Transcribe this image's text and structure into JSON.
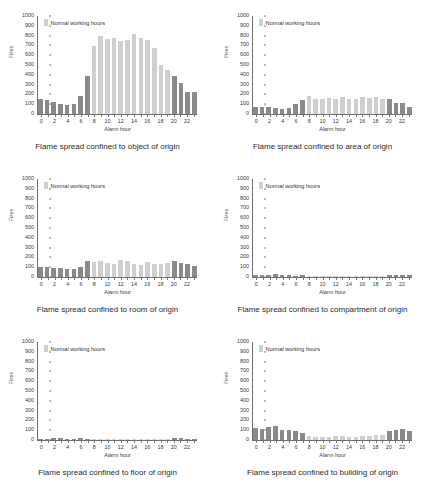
{
  "figure": {
    "legend_label": "Normal working hours",
    "xlabel": "Alarm hour",
    "ylabel": "Fires",
    "yticks": [
      1000,
      900,
      800,
      700,
      600,
      500,
      400,
      300,
      200,
      100,
      0
    ],
    "xticks": [
      0,
      2,
      4,
      6,
      8,
      10,
      12,
      14,
      16,
      18,
      20,
      22
    ],
    "colors": {
      "normal_working_hours": "#cfcfcf",
      "outside_working_hours": "#8a8a8a",
      "axis": "#6e6e6e",
      "text": "#2b2b2b",
      "background": "#ffffff"
    }
  },
  "chart_data": [
    {
      "type": "bar",
      "title": "Flame spread confined to object of origin",
      "xlabel": "Alarm hour",
      "ylabel": "Fires",
      "ylim": [
        0,
        1000
      ],
      "grid": false,
      "legend": "Normal working hours",
      "legend_position": "top-left",
      "categories": [
        0,
        1,
        2,
        3,
        4,
        5,
        6,
        7,
        8,
        9,
        10,
        11,
        12,
        13,
        14,
        15,
        16,
        17,
        18,
        19,
        20,
        21,
        22,
        23
      ],
      "values": [
        150,
        140,
        125,
        105,
        95,
        100,
        180,
        385,
        690,
        800,
        765,
        775,
        740,
        755,
        820,
        780,
        760,
        670,
        500,
        450,
        390,
        315,
        225,
        220
      ],
      "working_hours_mask": [
        false,
        false,
        false,
        false,
        false,
        false,
        false,
        false,
        true,
        true,
        true,
        true,
        true,
        true,
        true,
        true,
        true,
        true,
        true,
        true,
        false,
        false,
        false,
        false
      ]
    },
    {
      "type": "bar",
      "title": "Flame spread confined to area of origin",
      "xlabel": "Alarm hour",
      "ylabel": "Fires",
      "ylim": [
        0,
        1000
      ],
      "grid": false,
      "legend": "Normal working hours",
      "legend_position": "top-left",
      "categories": [
        0,
        1,
        2,
        3,
        4,
        5,
        6,
        7,
        8,
        9,
        10,
        11,
        12,
        13,
        14,
        15,
        16,
        17,
        18,
        19,
        20,
        21,
        22,
        23
      ],
      "values": [
        75,
        72,
        70,
        60,
        55,
        58,
        105,
        140,
        180,
        155,
        150,
        160,
        155,
        175,
        150,
        155,
        170,
        165,
        175,
        155,
        150,
        115,
        110,
        70
      ],
      "working_hours_mask": [
        false,
        false,
        false,
        false,
        false,
        false,
        false,
        false,
        true,
        true,
        true,
        true,
        true,
        true,
        true,
        true,
        true,
        true,
        true,
        true,
        false,
        false,
        false,
        false
      ]
    },
    {
      "type": "bar",
      "title": "Flame spread confined to room of origin",
      "xlabel": "Alarm hour",
      "ylabel": "Fires",
      "ylim": [
        0,
        1000
      ],
      "grid": false,
      "legend": "Normal working hours",
      "legend_position": "top-left",
      "categories": [
        0,
        1,
        2,
        3,
        4,
        5,
        6,
        7,
        8,
        9,
        10,
        11,
        12,
        13,
        14,
        15,
        16,
        17,
        18,
        19,
        20,
        21,
        22,
        23
      ],
      "values": [
        105,
        100,
        95,
        90,
        85,
        80,
        100,
        165,
        150,
        160,
        145,
        135,
        170,
        165,
        130,
        125,
        155,
        130,
        130,
        140,
        160,
        145,
        135,
        115
      ],
      "working_hours_mask": [
        false,
        false,
        false,
        false,
        false,
        false,
        false,
        false,
        true,
        true,
        true,
        true,
        true,
        true,
        true,
        true,
        true,
        true,
        true,
        true,
        false,
        false,
        false,
        false
      ]
    },
    {
      "type": "bar",
      "title": "Flame spread confined to compartment of origin",
      "xlabel": "Alarm hour",
      "ylabel": "Fires",
      "ylim": [
        0,
        1000
      ],
      "grid": false,
      "legend": "Normal working hours",
      "legend_position": "top-left",
      "categories": [
        0,
        1,
        2,
        3,
        4,
        5,
        6,
        7,
        8,
        9,
        10,
        11,
        12,
        13,
        14,
        15,
        16,
        17,
        18,
        19,
        20,
        21,
        22,
        23
      ],
      "values": [
        18,
        16,
        22,
        28,
        16,
        18,
        14,
        22,
        12,
        10,
        10,
        10,
        10,
        12,
        12,
        10,
        14,
        10,
        10,
        14,
        22,
        20,
        18,
        16
      ],
      "working_hours_mask": [
        false,
        false,
        false,
        false,
        false,
        false,
        false,
        false,
        true,
        true,
        true,
        true,
        true,
        true,
        true,
        true,
        true,
        true,
        true,
        true,
        false,
        false,
        false,
        false
      ]
    },
    {
      "type": "bar",
      "title": "Flame spread confined to floor of origin",
      "xlabel": "Alarm hour",
      "ylabel": "Fires",
      "ylim": [
        0,
        1000
      ],
      "grid": false,
      "legend": "Normal working hours",
      "legend_position": "top-left",
      "categories": [
        0,
        1,
        2,
        3,
        4,
        5,
        6,
        7,
        8,
        9,
        10,
        11,
        12,
        13,
        14,
        15,
        16,
        17,
        18,
        19,
        20,
        21,
        22,
        23
      ],
      "values": [
        12,
        12,
        20,
        18,
        12,
        12,
        16,
        14,
        10,
        8,
        8,
        8,
        8,
        8,
        8,
        8,
        12,
        8,
        8,
        10,
        18,
        16,
        14,
        12
      ],
      "working_hours_mask": [
        false,
        false,
        false,
        false,
        false,
        false,
        false,
        false,
        true,
        true,
        true,
        true,
        true,
        true,
        true,
        true,
        true,
        true,
        true,
        true,
        false,
        false,
        false,
        false
      ]
    },
    {
      "type": "bar",
      "title": "Flame spread confined to building of origin",
      "xlabel": "Alarm hour",
      "ylabel": "Fires",
      "ylim": [
        0,
        1000
      ],
      "grid": false,
      "legend": "Normal working hours",
      "legend_position": "top-left",
      "categories": [
        0,
        1,
        2,
        3,
        4,
        5,
        6,
        7,
        8,
        9,
        10,
        11,
        12,
        13,
        14,
        15,
        16,
        17,
        18,
        19,
        20,
        21,
        22,
        23
      ],
      "values": [
        120,
        115,
        130,
        145,
        100,
        105,
        95,
        70,
        40,
        35,
        35,
        30,
        45,
        40,
        35,
        30,
        40,
        45,
        50,
        55,
        90,
        100,
        115,
        95
      ],
      "working_hours_mask": [
        false,
        false,
        false,
        false,
        false,
        false,
        false,
        false,
        true,
        true,
        true,
        true,
        true,
        true,
        true,
        true,
        true,
        true,
        true,
        true,
        false,
        false,
        false,
        false
      ]
    }
  ]
}
